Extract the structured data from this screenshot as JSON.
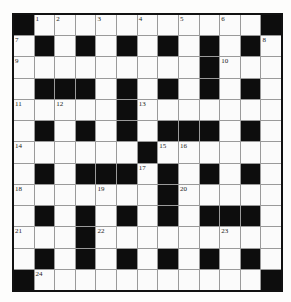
{
  "crossword": {
    "rows": 13,
    "cols": 13,
    "colors": {
      "black_cell": "#0d0d0d",
      "white_cell": "#fbfbfb",
      "grid_line": "#9a9a9a",
      "border": "#111111"
    },
    "layout": [
      "#.........#",
      "x"
    ],
    "grid": [
      [
        "#",
        "1",
        "2",
        ".",
        "3",
        ".",
        "4",
        ".",
        "5",
        ".",
        "6",
        ".",
        "#"
      ],
      [
        "7",
        "#",
        ".",
        "#",
        ".",
        "#",
        ".",
        "#",
        ".",
        "#",
        ".",
        "#",
        "8"
      ],
      [
        "9",
        ".",
        ".",
        ".",
        ".",
        ".",
        ".",
        ".",
        ".",
        "#",
        "10",
        ".",
        "."
      ],
      [
        ".",
        "#",
        "#",
        "#",
        ".",
        "#",
        ".",
        "#",
        ".",
        "#",
        ".",
        "#",
        "."
      ],
      [
        "11",
        ".",
        "12",
        ".",
        ".",
        "#",
        "13",
        ".",
        ".",
        ".",
        ".",
        ".",
        "."
      ],
      [
        ".",
        "#",
        ".",
        "#",
        ".",
        "#",
        ".",
        "#",
        "#",
        "#",
        ".",
        "#",
        "."
      ],
      [
        "14",
        ".",
        ".",
        ".",
        ".",
        ".",
        "#",
        "15",
        "16",
        ".",
        ".",
        ".",
        "."
      ],
      [
        ".",
        "#",
        ".",
        "#",
        "#",
        "#",
        "17",
        "#",
        ".",
        "#",
        ".",
        "#",
        "."
      ],
      [
        "18",
        ".",
        ".",
        ".",
        "19",
        ".",
        ".",
        "#",
        "20",
        ".",
        ".",
        ".",
        "."
      ],
      [
        ".",
        "#",
        ".",
        "#",
        ".",
        "#",
        ".",
        "#",
        ".",
        "#",
        "#",
        "#",
        "."
      ],
      [
        "21",
        ".",
        ".",
        "#",
        "22",
        ".",
        ".",
        ".",
        ".",
        ".",
        "23",
        ".",
        "."
      ],
      [
        ".",
        "#",
        ".",
        "#",
        ".",
        "#",
        ".",
        "#",
        ".",
        "#",
        ".",
        "#",
        "."
      ],
      [
        "#",
        "24",
        ".",
        ".",
        ".",
        ".",
        ".",
        ".",
        ".",
        ".",
        ".",
        ".",
        "#"
      ]
    ]
  }
}
